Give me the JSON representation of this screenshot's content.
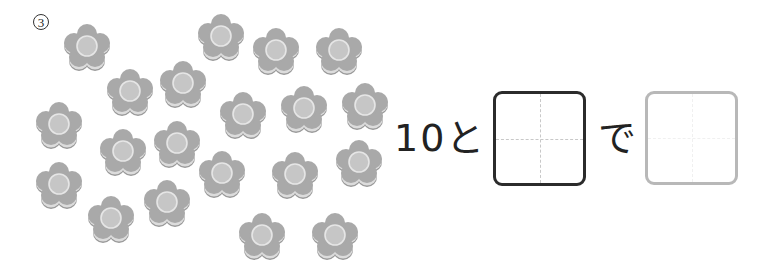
{
  "problem": {
    "number": "3",
    "number_glyph": "③"
  },
  "flowers": {
    "count": 20,
    "colors": {
      "petal": "#a9a9a9",
      "petal_edge": "#999999",
      "rim": "#dcdcdc",
      "center": "#c6c6c6",
      "center_ring": "#e6e6e6"
    },
    "positions": [
      {
        "x": 87,
        "y": 48
      },
      {
        "x": 221,
        "y": 38
      },
      {
        "x": 276,
        "y": 52
      },
      {
        "x": 339,
        "y": 52
      },
      {
        "x": 130,
        "y": 93
      },
      {
        "x": 183,
        "y": 85
      },
      {
        "x": 243,
        "y": 116
      },
      {
        "x": 304,
        "y": 110
      },
      {
        "x": 365,
        "y": 107
      },
      {
        "x": 59,
        "y": 126
      },
      {
        "x": 123,
        "y": 153
      },
      {
        "x": 177,
        "y": 145
      },
      {
        "x": 222,
        "y": 175
      },
      {
        "x": 295,
        "y": 176
      },
      {
        "x": 359,
        "y": 164
      },
      {
        "x": 59,
        "y": 186
      },
      {
        "x": 111,
        "y": 220
      },
      {
        "x": 167,
        "y": 204
      },
      {
        "x": 262,
        "y": 237
      },
      {
        "x": 335,
        "y": 237
      }
    ]
  },
  "equation": {
    "part1": "10と",
    "part2": "で",
    "box1": {
      "value": "",
      "style": "dark",
      "border_color": "#2b2b2b"
    },
    "box2": {
      "value": "",
      "style": "light",
      "border_color": "#b8b8b8"
    }
  }
}
